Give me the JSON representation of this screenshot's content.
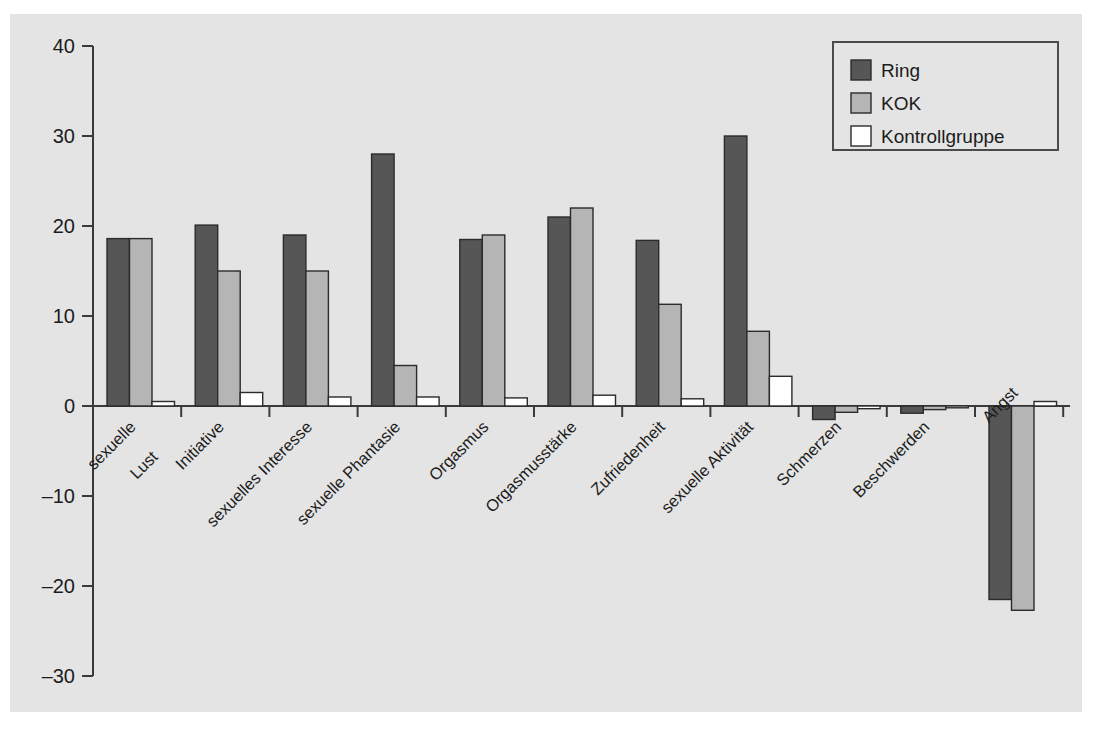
{
  "chart_data": {
    "type": "bar",
    "title": "",
    "subtitle": "",
    "xlabel": "",
    "ylabel": "",
    "ylim": [
      -30,
      40
    ],
    "yticks": [
      40,
      30,
      20,
      10,
      0,
      -10,
      -20,
      -30
    ],
    "ytick_labels": [
      "40",
      "30",
      "20",
      "10",
      "0",
      "–10",
      "–20",
      "–30"
    ],
    "grid": false,
    "legend_position": "top-right",
    "categories": [
      "sexuelle Lust",
      "Initiative",
      "sexuelles Interesse",
      "sexuelle Phantasie",
      "Orgasmus",
      "Orgasmusstärke",
      "Zufriedenheit",
      "sexuelle Aktivität",
      "Schmerzen",
      "Beschwerden",
      "Angst"
    ],
    "category_lines": [
      [
        "sexuelle",
        "Lust"
      ],
      [
        "Initiative"
      ],
      [
        "sexuelles Interesse"
      ],
      [
        "sexuelle Phantasie"
      ],
      [
        "Orgasmus"
      ],
      [
        "Orgasmusstärke"
      ],
      [
        "Zufriedenheit"
      ],
      [
        "sexuelle Aktivität"
      ],
      [
        "Schmerzen"
      ],
      [
        "Beschwerden"
      ],
      [
        "Angst"
      ]
    ],
    "series": [
      {
        "name": "Ring",
        "color": "#565656",
        "values": [
          18.6,
          20.1,
          19.0,
          28.0,
          18.5,
          21.0,
          18.4,
          30.0,
          -1.5,
          -0.8,
          -21.5
        ]
      },
      {
        "name": "KOK",
        "color": "#b5b5b5",
        "values": [
          18.6,
          15.0,
          15.0,
          4.5,
          19.0,
          22.0,
          11.3,
          8.3,
          -0.7,
          -0.4,
          -22.7
        ]
      },
      {
        "name": "Kontrollgruppe",
        "color": "#ffffff",
        "values": [
          0.5,
          1.5,
          1.0,
          1.0,
          0.9,
          1.2,
          0.8,
          3.3,
          -0.3,
          -0.2,
          0.5
        ]
      }
    ]
  },
  "legend": {
    "entries": [
      {
        "label": "Ring",
        "color": "#565656"
      },
      {
        "label": "KOK",
        "color": "#b5b5b5"
      },
      {
        "label": "Kontrollgruppe",
        "color": "#ffffff"
      }
    ]
  },
  "colors": {
    "background": "#e4e4e4",
    "page": "#ffffff",
    "axis": "#3a3a3a",
    "text": "#1c1c1c",
    "bar_stroke": "#2b2b2b"
  }
}
